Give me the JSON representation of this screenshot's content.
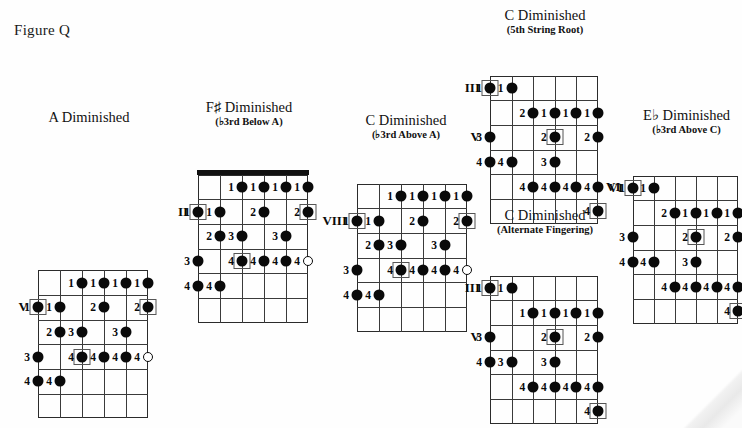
{
  "figure": {
    "label": "Figure Q"
  },
  "diagrams": [
    {
      "id": "a-diminished",
      "title": "A Diminished",
      "subtitle": "",
      "left_markers": [
        {
          "text": "V",
          "fret": 1
        }
      ],
      "right_markers": [],
      "has_nut": false,
      "strings": 6,
      "frets": 6,
      "notes": [
        {
          "string": 3,
          "fret": 0,
          "finger": "1",
          "root": false,
          "open": false
        },
        {
          "string": 4,
          "fret": 0,
          "finger": "1",
          "root": false,
          "open": false
        },
        {
          "string": 5,
          "fret": 0,
          "finger": "1",
          "root": false,
          "open": false
        },
        {
          "string": 6,
          "fret": 0,
          "finger": "1",
          "root": false,
          "open": false
        },
        {
          "string": 1,
          "fret": 1,
          "finger": "1",
          "root": true,
          "open": false
        },
        {
          "string": 2,
          "fret": 1,
          "finger": "1",
          "root": false,
          "open": false
        },
        {
          "string": 4,
          "fret": 1,
          "finger": "2",
          "root": false,
          "open": false
        },
        {
          "string": 6,
          "fret": 1,
          "finger": "2",
          "root": true,
          "open": false
        },
        {
          "string": 2,
          "fret": 2,
          "finger": "2",
          "root": false,
          "open": false
        },
        {
          "string": 3,
          "fret": 2,
          "finger": "3",
          "root": false,
          "open": false
        },
        {
          "string": 5,
          "fret": 2,
          "finger": "3",
          "root": false,
          "open": false
        },
        {
          "string": 1,
          "fret": 3,
          "finger": "3",
          "root": false,
          "open": false
        },
        {
          "string": 3,
          "fret": 3,
          "finger": "4",
          "root": true,
          "open": false
        },
        {
          "string": 4,
          "fret": 3,
          "finger": "4",
          "root": false,
          "open": false
        },
        {
          "string": 5,
          "fret": 3,
          "finger": "4",
          "root": false,
          "open": false
        },
        {
          "string": 6,
          "fret": 3,
          "finger": "4",
          "root": false,
          "open": true
        },
        {
          "string": 1,
          "fret": 4,
          "finger": "4",
          "root": false,
          "open": false
        },
        {
          "string": 2,
          "fret": 4,
          "finger": "4",
          "root": false,
          "open": false
        }
      ]
    },
    {
      "id": "fsharp-diminished",
      "title": "F♯ Diminished",
      "subtitle": "(♭3rd Below A)",
      "left_markers": [
        {
          "text": "II",
          "fret": 1
        }
      ],
      "right_markers": [],
      "has_nut": true,
      "strings": 6,
      "frets": 6,
      "notes": [
        {
          "string": 3,
          "fret": 0,
          "finger": "1",
          "root": false,
          "open": false
        },
        {
          "string": 4,
          "fret": 0,
          "finger": "1",
          "root": false,
          "open": false
        },
        {
          "string": 5,
          "fret": 0,
          "finger": "1",
          "root": false,
          "open": false
        },
        {
          "string": 6,
          "fret": 0,
          "finger": "1",
          "root": false,
          "open": false
        },
        {
          "string": 1,
          "fret": 1,
          "finger": "1",
          "root": true,
          "open": false
        },
        {
          "string": 2,
          "fret": 1,
          "finger": "1",
          "root": false,
          "open": false
        },
        {
          "string": 4,
          "fret": 1,
          "finger": "2",
          "root": false,
          "open": false
        },
        {
          "string": 6,
          "fret": 1,
          "finger": "2",
          "root": true,
          "open": false
        },
        {
          "string": 2,
          "fret": 2,
          "finger": "2",
          "root": false,
          "open": false
        },
        {
          "string": 3,
          "fret": 2,
          "finger": "3",
          "root": false,
          "open": false
        },
        {
          "string": 5,
          "fret": 2,
          "finger": "3",
          "root": false,
          "open": false
        },
        {
          "string": 1,
          "fret": 3,
          "finger": "3",
          "root": false,
          "open": false
        },
        {
          "string": 3,
          "fret": 3,
          "finger": "4",
          "root": true,
          "open": false
        },
        {
          "string": 4,
          "fret": 3,
          "finger": "4",
          "root": false,
          "open": false
        },
        {
          "string": 5,
          "fret": 3,
          "finger": "4",
          "root": false,
          "open": false
        },
        {
          "string": 6,
          "fret": 3,
          "finger": "4",
          "root": false,
          "open": true
        },
        {
          "string": 1,
          "fret": 4,
          "finger": "4",
          "root": false,
          "open": false
        },
        {
          "string": 2,
          "fret": 4,
          "finger": "4",
          "root": false,
          "open": false
        }
      ]
    },
    {
      "id": "c-diminished-above-a",
      "title": "C Diminished",
      "subtitle": "(♭3rd Above A)",
      "left_markers": [
        {
          "text": "VIII",
          "fret": 1
        }
      ],
      "right_markers": [],
      "has_nut": false,
      "strings": 6,
      "frets": 6,
      "notes": [
        {
          "string": 3,
          "fret": 0,
          "finger": "1",
          "root": false,
          "open": false
        },
        {
          "string": 4,
          "fret": 0,
          "finger": "1",
          "root": false,
          "open": false
        },
        {
          "string": 5,
          "fret": 0,
          "finger": "1",
          "root": false,
          "open": false
        },
        {
          "string": 6,
          "fret": 0,
          "finger": "1",
          "root": false,
          "open": false
        },
        {
          "string": 1,
          "fret": 1,
          "finger": "1",
          "root": true,
          "open": false
        },
        {
          "string": 2,
          "fret": 1,
          "finger": "1",
          "root": false,
          "open": false
        },
        {
          "string": 4,
          "fret": 1,
          "finger": "2",
          "root": false,
          "open": false
        },
        {
          "string": 6,
          "fret": 1,
          "finger": "2",
          "root": true,
          "open": false
        },
        {
          "string": 2,
          "fret": 2,
          "finger": "2",
          "root": false,
          "open": false
        },
        {
          "string": 3,
          "fret": 2,
          "finger": "3",
          "root": false,
          "open": false
        },
        {
          "string": 5,
          "fret": 2,
          "finger": "3",
          "root": false,
          "open": false
        },
        {
          "string": 1,
          "fret": 3,
          "finger": "3",
          "root": false,
          "open": false
        },
        {
          "string": 3,
          "fret": 3,
          "finger": "4",
          "root": true,
          "open": false
        },
        {
          "string": 4,
          "fret": 3,
          "finger": "4",
          "root": false,
          "open": false
        },
        {
          "string": 5,
          "fret": 3,
          "finger": "4",
          "root": false,
          "open": false
        },
        {
          "string": 6,
          "fret": 3,
          "finger": "4",
          "root": false,
          "open": true
        },
        {
          "string": 1,
          "fret": 4,
          "finger": "4",
          "root": false,
          "open": false
        },
        {
          "string": 2,
          "fret": 4,
          "finger": "4",
          "root": false,
          "open": false
        }
      ]
    },
    {
      "id": "c-diminished-5th-string-root",
      "title": "C Diminished",
      "subtitle": "(5th String Root)",
      "left_markers": [
        {
          "text": "III",
          "fret": 0
        },
        {
          "text": "V",
          "fret": 2
        }
      ],
      "right_markers": [
        {
          "text": "VI",
          "fret": 4
        }
      ],
      "has_nut": false,
      "strings": 6,
      "frets": 6,
      "notes": [
        {
          "string": 1,
          "fret": 0,
          "finger": "1",
          "root": true,
          "open": false
        },
        {
          "string": 2,
          "fret": 0,
          "finger": "1",
          "root": false,
          "open": false
        },
        {
          "string": 3,
          "fret": 1,
          "finger": "2",
          "root": false,
          "open": false
        },
        {
          "string": 4,
          "fret": 1,
          "finger": "1",
          "root": false,
          "open": false
        },
        {
          "string": 5,
          "fret": 1,
          "finger": "1",
          "root": false,
          "open": false
        },
        {
          "string": 6,
          "fret": 1,
          "finger": "1",
          "root": false,
          "open": false
        },
        {
          "string": 1,
          "fret": 2,
          "finger": "3",
          "root": false,
          "open": false
        },
        {
          "string": 4,
          "fret": 2,
          "finger": "2",
          "root": true,
          "open": false
        },
        {
          "string": 6,
          "fret": 2,
          "finger": "2",
          "root": false,
          "open": false
        },
        {
          "string": 1,
          "fret": 3,
          "finger": "4",
          "root": false,
          "open": false
        },
        {
          "string": 2,
          "fret": 3,
          "finger": "4",
          "root": false,
          "open": false
        },
        {
          "string": 4,
          "fret": 3,
          "finger": "3",
          "root": false,
          "open": false
        },
        {
          "string": 3,
          "fret": 4,
          "finger": "4",
          "root": false,
          "open": false
        },
        {
          "string": 4,
          "fret": 4,
          "finger": "4",
          "root": false,
          "open": false
        },
        {
          "string": 5,
          "fret": 4,
          "finger": "4",
          "root": false,
          "open": false
        },
        {
          "string": 6,
          "fret": 4,
          "finger": "4",
          "root": false,
          "open": false
        },
        {
          "string": 6,
          "fret": 5,
          "finger": "4",
          "root": true,
          "open": false
        }
      ]
    },
    {
      "id": "c-diminished-alternate-fingering",
      "title": "C Diminished",
      "subtitle": "(Alternate Fingering)",
      "left_markers": [
        {
          "text": "III",
          "fret": 0
        },
        {
          "text": "V",
          "fret": 2
        }
      ],
      "right_markers": [],
      "has_nut": false,
      "strings": 6,
      "frets": 6,
      "notes": [
        {
          "string": 1,
          "fret": 0,
          "finger": "1",
          "root": true,
          "open": false
        },
        {
          "string": 2,
          "fret": 0,
          "finger": "1",
          "root": false,
          "open": false
        },
        {
          "string": 3,
          "fret": 1,
          "finger": "1",
          "root": false,
          "open": false
        },
        {
          "string": 4,
          "fret": 1,
          "finger": "1",
          "root": false,
          "open": false
        },
        {
          "string": 5,
          "fret": 1,
          "finger": "1",
          "root": false,
          "open": false
        },
        {
          "string": 6,
          "fret": 1,
          "finger": "1",
          "root": false,
          "open": false
        },
        {
          "string": 1,
          "fret": 2,
          "finger": "3",
          "root": false,
          "open": false
        },
        {
          "string": 4,
          "fret": 2,
          "finger": "2",
          "root": true,
          "open": false
        },
        {
          "string": 6,
          "fret": 2,
          "finger": "2",
          "root": false,
          "open": false
        },
        {
          "string": 1,
          "fret": 3,
          "finger": "4",
          "root": false,
          "open": false
        },
        {
          "string": 2,
          "fret": 3,
          "finger": "3",
          "root": false,
          "open": false
        },
        {
          "string": 4,
          "fret": 3,
          "finger": "3",
          "root": false,
          "open": false
        },
        {
          "string": 3,
          "fret": 4,
          "finger": "4",
          "root": false,
          "open": false
        },
        {
          "string": 4,
          "fret": 4,
          "finger": "4",
          "root": false,
          "open": false
        },
        {
          "string": 5,
          "fret": 4,
          "finger": "4",
          "root": false,
          "open": false
        },
        {
          "string": 6,
          "fret": 4,
          "finger": "4",
          "root": false,
          "open": false
        },
        {
          "string": 6,
          "fret": 5,
          "finger": "4",
          "root": true,
          "open": false
        }
      ]
    },
    {
      "id": "eflat-diminished",
      "title": "E♭ Diminished",
      "subtitle": "(♭3rd Above C)",
      "left_markers": [
        {
          "text": "VI",
          "fret": 0
        }
      ],
      "right_markers": [],
      "has_nut": false,
      "strings": 6,
      "frets": 6,
      "notes": [
        {
          "string": 1,
          "fret": 0,
          "finger": "1",
          "root": true,
          "open": false
        },
        {
          "string": 2,
          "fret": 0,
          "finger": "1",
          "root": false,
          "open": false
        },
        {
          "string": 3,
          "fret": 1,
          "finger": "2",
          "root": false,
          "open": false
        },
        {
          "string": 4,
          "fret": 1,
          "finger": "1",
          "root": false,
          "open": false
        },
        {
          "string": 5,
          "fret": 1,
          "finger": "1",
          "root": false,
          "open": false
        },
        {
          "string": 6,
          "fret": 1,
          "finger": "1",
          "root": false,
          "open": false
        },
        {
          "string": 1,
          "fret": 2,
          "finger": "3",
          "root": false,
          "open": false
        },
        {
          "string": 4,
          "fret": 2,
          "finger": "2",
          "root": true,
          "open": false
        },
        {
          "string": 6,
          "fret": 2,
          "finger": "2",
          "root": false,
          "open": false
        },
        {
          "string": 1,
          "fret": 3,
          "finger": "4",
          "root": false,
          "open": false
        },
        {
          "string": 2,
          "fret": 3,
          "finger": "4",
          "root": false,
          "open": false
        },
        {
          "string": 4,
          "fret": 3,
          "finger": "3",
          "root": false,
          "open": false
        },
        {
          "string": 3,
          "fret": 4,
          "finger": "4",
          "root": false,
          "open": false
        },
        {
          "string": 4,
          "fret": 4,
          "finger": "4",
          "root": false,
          "open": false
        },
        {
          "string": 5,
          "fret": 4,
          "finger": "4",
          "root": false,
          "open": false
        },
        {
          "string": 6,
          "fret": 4,
          "finger": "4",
          "root": false,
          "open": false
        },
        {
          "string": 6,
          "fret": 5,
          "finger": "4",
          "root": true,
          "open": false
        }
      ]
    }
  ],
  "layout": {
    "positions": [
      {
        "id": "a-diminished",
        "left": 10,
        "top": 110,
        "board_left": 28,
        "board_top": 145,
        "width": 110,
        "height": 148
      },
      {
        "id": "fsharp-diminished",
        "left": 170,
        "top": 100,
        "board_left": 28,
        "board_top": 47,
        "width": 110,
        "height": 148
      },
      {
        "id": "c-diminished-above-a",
        "left": 325,
        "top": 113,
        "board_left": 32,
        "board_top": 43,
        "width": 110,
        "height": 148
      },
      {
        "id": "c-diminished-5th-string-root",
        "left": 472,
        "top": 8,
        "board_left": 18,
        "board_top": 40,
        "width": 108,
        "height": 148
      },
      {
        "id": "c-diminished-alternate-fingering",
        "left": 472,
        "top": 208,
        "board_left": 18,
        "board_top": 40,
        "width": 108,
        "height": 148
      },
      {
        "id": "eflat-diminished",
        "left": 615,
        "top": 108,
        "board_left": 18,
        "board_top": 40,
        "width": 105,
        "height": 148
      }
    ]
  }
}
